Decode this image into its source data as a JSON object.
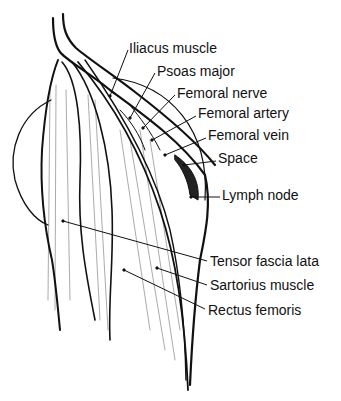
{
  "diagram": {
    "line_color": "#111111",
    "background": "#ffffff",
    "labels": [
      {
        "id": "iliacus",
        "text": "Iliacus muscle",
        "x": 129,
        "y": 41,
        "pointer": [
          [
            128,
            50
          ],
          [
            110,
            96
          ]
        ]
      },
      {
        "id": "psoas",
        "text": "Psoas major",
        "x": 157,
        "y": 64,
        "pointer": [
          [
            155,
            73
          ],
          [
            130,
            118
          ]
        ]
      },
      {
        "id": "femoral-nerve",
        "text": "Femoral nerve",
        "x": 177,
        "y": 86,
        "pointer": [
          [
            175,
            95
          ],
          [
            143,
            128
          ]
        ]
      },
      {
        "id": "femoral-artery",
        "text": "Femoral artery",
        "x": 198,
        "y": 106,
        "pointer": [
          [
            196,
            116
          ],
          [
            152,
            140
          ]
        ]
      },
      {
        "id": "femoral-vein",
        "text": "Femoral vein",
        "x": 208,
        "y": 128,
        "pointer": [
          [
            206,
            138
          ],
          [
            165,
            155
          ]
        ]
      },
      {
        "id": "space",
        "text": "Space",
        "x": 218,
        "y": 151,
        "pointer": [
          [
            216,
            161
          ],
          [
            184,
            165
          ]
        ]
      },
      {
        "id": "lymph-node",
        "text": "Lymph node",
        "x": 222,
        "y": 188,
        "pointer": [
          [
            220,
            197
          ],
          [
            191,
            197
          ]
        ]
      },
      {
        "id": "tensor-fascia-lata",
        "text": "Tensor fascia lata",
        "x": 210,
        "y": 254,
        "pointer": [
          [
            207,
            261
          ],
          [
            63,
            221
          ]
        ]
      },
      {
        "id": "sartorius",
        "text": "Sartorius muscle",
        "x": 210,
        "y": 278,
        "pointer": [
          [
            207,
            285
          ],
          [
            157,
            268
          ]
        ]
      },
      {
        "id": "rectus-femoris",
        "text": "Rectus femoris",
        "x": 208,
        "y": 303,
        "pointer": [
          [
            205,
            309
          ],
          [
            124,
            270
          ]
        ]
      }
    ]
  }
}
